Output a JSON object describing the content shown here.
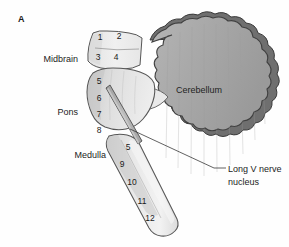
{
  "figure": {
    "panel_letter": "A",
    "width": 289,
    "height": 247
  },
  "region_labels": {
    "midbrain": "Midbrain",
    "pons": "Pons",
    "medulla": "Medulla",
    "cerebellum": "Cerebellum"
  },
  "callout": {
    "line1": "Long V nerve",
    "line2": "nucleus"
  },
  "cranial_nerve_numbers": {
    "midbrain": [
      {
        "label": "1",
        "x": 100,
        "y": 40
      },
      {
        "label": "2",
        "x": 119,
        "y": 39
      },
      {
        "label": "3",
        "x": 98,
        "y": 60
      },
      {
        "label": "4",
        "x": 116,
        "y": 60
      }
    ],
    "pons": [
      {
        "label": "5",
        "x": 99,
        "y": 84
      },
      {
        "label": "6",
        "x": 99,
        "y": 101
      },
      {
        "label": "7",
        "x": 99,
        "y": 117
      },
      {
        "label": "8",
        "x": 99,
        "y": 133
      }
    ],
    "medulla": [
      {
        "label": "5",
        "x": 128,
        "y": 150
      },
      {
        "label": "9",
        "x": 122,
        "y": 167
      },
      {
        "label": "10",
        "x": 132,
        "y": 185
      },
      {
        "label": "11",
        "x": 142,
        "y": 204
      },
      {
        "label": "12",
        "x": 150,
        "y": 221
      }
    ]
  },
  "colors": {
    "cerebellum_fill": "#a9a9a9",
    "cerebellum_rim": "#737373",
    "cerebellum_outline": "#3f3f3f",
    "pons_fill": "#d8d8d8",
    "midbrain_fill": "#ececec",
    "medulla_fill": "#e4e4e4",
    "nucleus_fill": "#b6b6b6",
    "outline": "#4a4a4a",
    "text": "#1c1c1c",
    "background": "#fefefe"
  }
}
